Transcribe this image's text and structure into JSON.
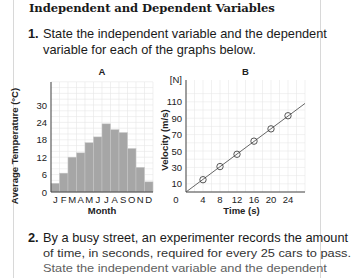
{
  "section_title": "Independent and Dependent Variables",
  "questions": [
    {
      "number": "1.",
      "lines": [
        "State the independent variable and the dependent",
        "variable for each of the graphs below."
      ]
    },
    {
      "number": "2.",
      "lines": [
        "By a busy street, an experimenter records the amount",
        "of time, in seconds, required for every 25 cars to pass.",
        "State the independent variable and the dependent"
      ]
    }
  ],
  "chart_data": [
    {
      "type": "bar",
      "title": "A",
      "xlabel": "Month",
      "ylabel": "Average Temperature (°C)",
      "categories": [
        "J",
        "F",
        "M",
        "A",
        "M",
        "J",
        "J",
        "A",
        "S",
        "O",
        "N",
        "D"
      ],
      "values": [
        3,
        6.5,
        12,
        13.5,
        17,
        19,
        23.5,
        21.5,
        20.5,
        15,
        8.5,
        3.5
      ],
      "yticks": [
        0,
        6,
        12,
        18,
        24,
        30
      ],
      "ylim": [
        0,
        38
      ],
      "grid": true,
      "bar_color": "#a6a6a6"
    },
    {
      "type": "line",
      "title": "B",
      "xlabel": "Time (s)",
      "ylabel": "Velocity (m/s)",
      "y_top_label": "[N]",
      "x": [
        4,
        8,
        12,
        16,
        20,
        24
      ],
      "values": [
        15,
        31,
        46,
        62,
        77,
        93
      ],
      "line_fit": {
        "x": [
          0,
          28
        ],
        "y": [
          0,
          108
        ]
      },
      "xticks": [
        0,
        4,
        8,
        12,
        16,
        20,
        24
      ],
      "yticks": [
        10,
        30,
        50,
        70,
        90,
        110
      ],
      "xlim": [
        0,
        28
      ],
      "ylim": [
        0,
        120
      ],
      "grid": true,
      "marker": "circle-slash"
    }
  ]
}
